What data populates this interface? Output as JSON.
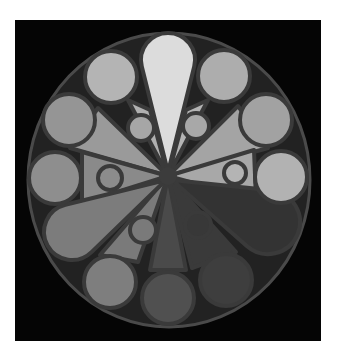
{
  "figure": {
    "frame": {
      "x": 15,
      "y": 20,
      "w": 306,
      "h": 321,
      "color": "#050505"
    },
    "outline_color": "#3a3a3a",
    "outer_ring": {
      "cx": 169,
      "cy": 180,
      "rx": 141,
      "ry": 147,
      "fill": "#222222"
    },
    "hub": {
      "cx": 168,
      "cy": 176,
      "r": 9,
      "fill": "#3c3c3c"
    },
    "wedges": [
      {
        "name": "wedge-upper-left",
        "points": "168,176 98,108 70,148",
        "fill": "#9a9a9a"
      },
      {
        "name": "wedge-upper-right",
        "points": "168,176 238,106 268,148",
        "fill": "#a4a4a4"
      },
      {
        "name": "wedge-left",
        "points": "168,176 82,152 82,203",
        "fill": "#8a8a8a"
      },
      {
        "name": "wedge-right",
        "points": "168,176 254,150 256,200",
        "fill": "#a8a8a8"
      },
      {
        "name": "wedge-top-left",
        "points": "168,176 128,100 150,110",
        "fill": "#b0b0b0"
      },
      {
        "name": "wedge-top-right",
        "points": "168,176 208,100 186,110",
        "fill": "#b4b4b4"
      },
      {
        "name": "wedge-lower-left",
        "points": "168,176 100,255 138,262",
        "fill": "#7a7a7a"
      },
      {
        "name": "wedge-bottom",
        "points": "168,176 150,270 186,270",
        "fill": "#4a4a4a"
      },
      {
        "name": "wedge-lower-right",
        "points": "168,176 192,268 236,252",
        "fill": "#3a3a3a"
      }
    ],
    "petals": [
      {
        "name": "petal-top",
        "tip": [
          168,
          172
        ],
        "cx": 168,
        "cy": 60,
        "r": 27,
        "fill": "#dcdcdc"
      },
      {
        "name": "petal-lower-left",
        "tip": [
          166,
          180
        ],
        "cx": 72,
        "cy": 232,
        "r": 28,
        "fill": "#7c7c7c"
      },
      {
        "name": "petal-lower-right",
        "tip": [
          172,
          180
        ],
        "cx": 268,
        "cy": 222,
        "r": 32,
        "fill": "#333333"
      }
    ],
    "lobes": [
      {
        "name": "lobe-upper-left",
        "cx": 141,
        "cy": 128,
        "r": 13,
        "fill": "#a6a6a6"
      },
      {
        "name": "lobe-upper-right",
        "cx": 196,
        "cy": 126,
        "r": 13,
        "fill": "#a8a8a8"
      },
      {
        "name": "lobe-left",
        "cx": 110,
        "cy": 178,
        "r": 12,
        "fill": "#8c8c8c"
      },
      {
        "name": "lobe-right",
        "cx": 235,
        "cy": 173,
        "r": 11,
        "fill": "#b4b4b4"
      },
      {
        "name": "lobe-lower-left",
        "cx": 143,
        "cy": 230,
        "r": 13,
        "fill": "#7a7a7a"
      },
      {
        "name": "lobe-lower-right",
        "cx": 198,
        "cy": 225,
        "r": 13,
        "fill": "#383838"
      }
    ],
    "circles": [
      {
        "name": "circle-top-left",
        "cx": 111,
        "cy": 77,
        "r": 26,
        "fill": "#b4b4b4"
      },
      {
        "name": "circle-top-right",
        "cx": 224,
        "cy": 76,
        "r": 26,
        "fill": "#adadad"
      },
      {
        "name": "circle-left-upper",
        "cx": 69,
        "cy": 120,
        "r": 26,
        "fill": "#959595"
      },
      {
        "name": "circle-right-upper",
        "cx": 266,
        "cy": 120,
        "r": 26,
        "fill": "#a2a2a2"
      },
      {
        "name": "circle-left-middle",
        "cx": 55,
        "cy": 178,
        "r": 26,
        "fill": "#8e8e8e"
      },
      {
        "name": "circle-right-middle",
        "cx": 281,
        "cy": 177,
        "r": 26,
        "fill": "#b2b2b2"
      },
      {
        "name": "circle-bottom-left",
        "cx": 110,
        "cy": 282,
        "r": 26,
        "fill": "#7e7e7e"
      },
      {
        "name": "circle-bottom",
        "cx": 168,
        "cy": 298,
        "r": 26,
        "fill": "#505050"
      },
      {
        "name": "circle-bottom-right",
        "cx": 226,
        "cy": 280,
        "r": 26,
        "fill": "#3e3e3e"
      }
    ]
  }
}
